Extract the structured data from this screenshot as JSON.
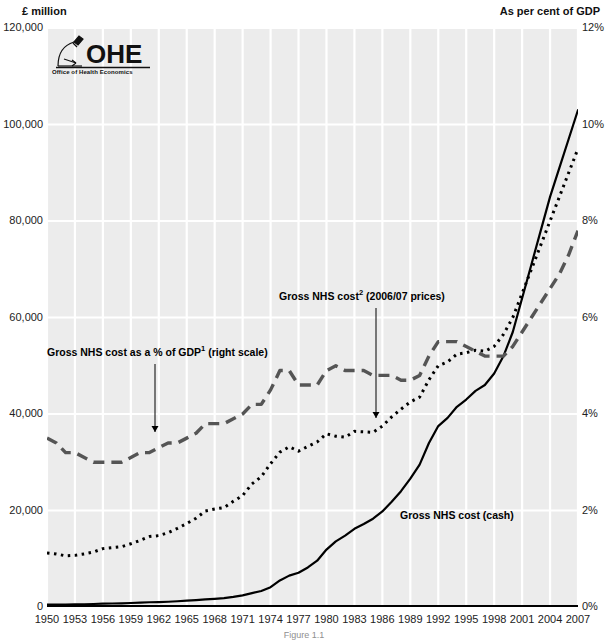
{
  "figure": {
    "left_axis_title": "£ million",
    "right_axis_title": "As per cent of GDP",
    "caption": "Figure 1.1",
    "logo": {
      "wordmark": "OHE",
      "subtitle": "Office of Health Economics",
      "icon": "microscope-icon"
    }
  },
  "annotations": {
    "gdp_share": {
      "prefix": "Gross NHS cost as a % of GDP",
      "footnote": "1",
      "suffix": " (right scale)"
    },
    "real_terms": {
      "prefix": "Gross NHS cost",
      "footnote": "2",
      "suffix": " (2006/07 prices)"
    },
    "cash": {
      "prefix": "Gross NHS cost (cash)",
      "footnote": "",
      "suffix": ""
    }
  },
  "chart_data": {
    "type": "line",
    "title": "",
    "subtitle": "",
    "xlabel": "",
    "ylabel": "£ million",
    "y2label": "As per cent of GDP",
    "grid": true,
    "legend_position": "inline-annotations",
    "xlim": [
      1950,
      2007
    ],
    "ylim": [
      0,
      120000
    ],
    "y2lim": [
      0,
      12
    ],
    "xticks": [
      1950,
      1953,
      1956,
      1959,
      1962,
      1965,
      1968,
      1971,
      1974,
      1977,
      1980,
      1983,
      1986,
      1989,
      1992,
      1995,
      1998,
      2001,
      2004,
      2007
    ],
    "xticklabels": [
      "1950",
      "1953",
      "1956",
      "1959",
      "1962",
      "1965",
      "1968",
      "1971",
      "1974",
      "1977",
      "1980",
      "1983",
      "1986",
      "1989",
      "1992",
      "1995",
      "1998",
      "2001",
      "2004",
      "2007"
    ],
    "yticks": [
      0,
      20000,
      40000,
      60000,
      80000,
      100000,
      120000
    ],
    "yticklabels": [
      "0",
      "20,000",
      "40,000",
      "60,000",
      "80,000",
      "100,000",
      "120,000"
    ],
    "y2ticks": [
      0,
      2,
      4,
      6,
      8,
      10,
      12
    ],
    "y2ticklabels": [
      "0%",
      "2%",
      "4%",
      "6%",
      "8%",
      "10%",
      "12%"
    ],
    "x": [
      1950,
      1951,
      1952,
      1953,
      1954,
      1955,
      1956,
      1957,
      1958,
      1959,
      1960,
      1961,
      1962,
      1963,
      1964,
      1965,
      1966,
      1967,
      1968,
      1969,
      1970,
      1971,
      1972,
      1973,
      1974,
      1975,
      1976,
      1977,
      1978,
      1979,
      1980,
      1981,
      1982,
      1983,
      1984,
      1985,
      1986,
      1987,
      1988,
      1989,
      1990,
      1991,
      1992,
      1993,
      1994,
      1995,
      1996,
      1997,
      1998,
      1999,
      2000,
      2001,
      2002,
      2003,
      2004,
      2005,
      2006,
      2007
    ],
    "series": [
      {
        "name": "Gross NHS cost (cash)",
        "axis": "left",
        "units": "£ million",
        "style": "solid",
        "color": "#000000",
        "values": [
          477,
          500,
          510,
          546,
          575,
          621,
          687,
          729,
          771,
          825,
          892,
          981,
          1025,
          1092,
          1190,
          1306,
          1430,
          1594,
          1702,
          1829,
          2084,
          2419,
          2881,
          3322,
          4100,
          5500,
          6500,
          7100,
          8200,
          9600,
          11900,
          13600,
          14800,
          16200,
          17200,
          18300,
          19800,
          21800,
          24000,
          26600,
          29500,
          34000,
          37500,
          39200,
          41500,
          43000,
          44800,
          46000,
          48400,
          52000,
          57000,
          64000,
          71000,
          78000,
          85000,
          91000,
          97000,
          103000
        ]
      },
      {
        "name": "Gross NHS cost (2006/07 prices)",
        "axis": "left",
        "units": "£ million",
        "style": "dotted",
        "color": "#000000",
        "values": [
          11200,
          11000,
          10600,
          10700,
          11000,
          11400,
          12100,
          12300,
          12500,
          13100,
          13800,
          14600,
          14800,
          15400,
          16300,
          17300,
          18400,
          19900,
          20300,
          20600,
          21900,
          23100,
          25500,
          27000,
          29700,
          32100,
          33200,
          32300,
          33300,
          34200,
          35900,
          35400,
          35200,
          36400,
          36300,
          36200,
          37500,
          39400,
          41000,
          42500,
          43500,
          47100,
          50000,
          50800,
          52400,
          52700,
          53200,
          53000,
          54000,
          56500,
          60000,
          65000,
          70000,
          75000,
          80000,
          85000,
          90000,
          95000
        ]
      },
      {
        "name": "Gross NHS cost as a % of GDP",
        "axis": "right",
        "units": "%",
        "style": "dashed",
        "color": "#555555",
        "values": [
          3.5,
          3.4,
          3.2,
          3.2,
          3.1,
          3.0,
          3.0,
          3.0,
          3.0,
          3.1,
          3.2,
          3.2,
          3.3,
          3.4,
          3.4,
          3.5,
          3.6,
          3.8,
          3.8,
          3.8,
          3.9,
          4.0,
          4.2,
          4.2,
          4.5,
          4.9,
          4.9,
          4.6,
          4.6,
          4.6,
          4.9,
          5.0,
          4.9,
          4.9,
          4.9,
          4.8,
          4.8,
          4.8,
          4.7,
          4.7,
          4.8,
          5.2,
          5.5,
          5.5,
          5.5,
          5.4,
          5.3,
          5.2,
          5.2,
          5.2,
          5.4,
          5.7,
          6.0,
          6.3,
          6.6,
          6.9,
          7.3,
          7.8
        ]
      }
    ]
  }
}
